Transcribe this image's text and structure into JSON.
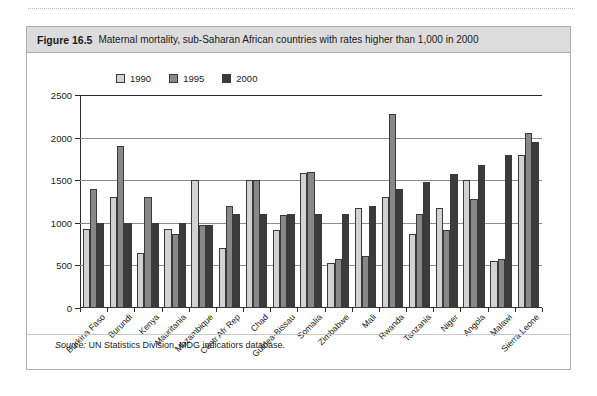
{
  "figure": {
    "number": "Figure 16.5",
    "caption": "Maternal mortality, sub-Saharan African countries with rates higher than 1,000 in 2000",
    "source_prefix": "Source:",
    "source_text": "UN Statistics Division, MDG indicatiors database."
  },
  "colors": {
    "series_1990": "#d2d2d2",
    "series_1995": "#888888",
    "series_2000": "#3b3b3b",
    "header_bg": "#dcdcdc",
    "frame": "#adadad",
    "axis": "#2b2b2b",
    "grid": "#8c8c8c"
  },
  "chart_data": {
    "type": "bar",
    "title": "Maternal mortality, sub-Saharan African countries with rates higher than 1,000 in 2000",
    "xlabel": "",
    "ylabel": "",
    "ylim": [
      0,
      2500
    ],
    "yticks": [
      0,
      500,
      1000,
      1500,
      2000,
      2500
    ],
    "ytick_labels": [
      "0",
      "500",
      "1000",
      "1500",
      "2000",
      "2500"
    ],
    "grid": true,
    "legend_position": "top-left-inside",
    "categories": [
      "Burkina Faso",
      "Burundi",
      "Kenya",
      "Mauritania",
      "Mozambique",
      "Centr Afr Rep",
      "Chad",
      "Guinea-Bissau",
      "Somalia",
      "Zimbabwe",
      "Mali",
      "Rwanda",
      "Tanzania",
      "Niger",
      "Angola",
      "Malawi",
      "Sierra Leone"
    ],
    "series": [
      {
        "name": "1990",
        "color": "#d2d2d2",
        "values": [
          930,
          1300,
          640,
          930,
          1500,
          700,
          1500,
          910,
          1580,
          530,
          1170,
          1300,
          870,
          1170,
          1500,
          550,
          1800
        ]
      },
      {
        "name": "1995",
        "color": "#888888",
        "values": [
          1400,
          1900,
          1300,
          870,
          980,
          1200,
          1500,
          1090,
          1600,
          580,
          610,
          2280,
          1100,
          920,
          1280,
          580,
          2050
        ]
      },
      {
        "name": "2000",
        "color": "#3b3b3b",
        "values": [
          1000,
          1000,
          1000,
          1000,
          980,
          1100,
          1100,
          1100,
          1100,
          1100,
          1200,
          1400,
          1480,
          1570,
          1680,
          1800,
          1950
        ]
      }
    ]
  }
}
